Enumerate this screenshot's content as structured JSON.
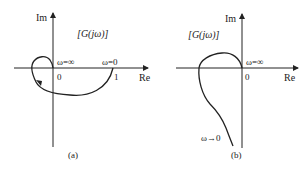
{
  "panels": [
    {
      "id": "a",
      "caption": "(a)",
      "function_label": "[G(jω)]",
      "axis": {
        "x_label": "Re",
        "y_label": "Im"
      },
      "ticks": {
        "origin": "0",
        "one": "1"
      },
      "annotations": {
        "omega_inf": "ω=∞",
        "omega_zero": "ω=0"
      }
    },
    {
      "id": "b",
      "caption": "(b)",
      "function_label": "[G(jω)]",
      "axis": {
        "x_label": "Re",
        "y_label": "Im"
      },
      "ticks": {
        "origin": "0"
      },
      "annotations": {
        "omega_inf": "ω=∞",
        "omega_zero": "ω→0"
      }
    }
  ],
  "colors": {
    "line": "#222222",
    "background": "#ffffff"
  }
}
